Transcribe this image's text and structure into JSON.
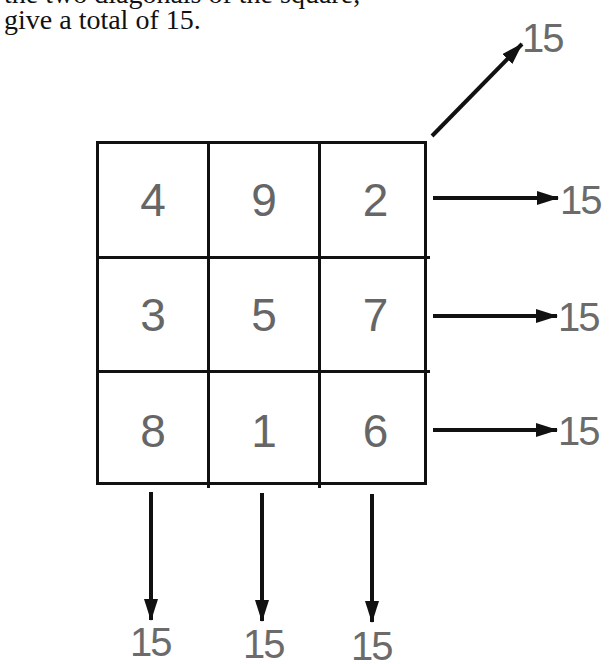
{
  "text": {
    "clipped_line": "the two diagonals of the square,",
    "caption": "give a total of 15."
  },
  "magic_square": {
    "rows": [
      [
        "4",
        "9",
        "2"
      ],
      [
        "3",
        "5",
        "7"
      ],
      [
        "8",
        "1",
        "6"
      ]
    ],
    "number_color": "#666666",
    "line_color": "#111111"
  },
  "sums": {
    "diagonal": "15",
    "rows": [
      "15",
      "15",
      "15"
    ],
    "columns": [
      "15",
      "15",
      "15"
    ]
  }
}
